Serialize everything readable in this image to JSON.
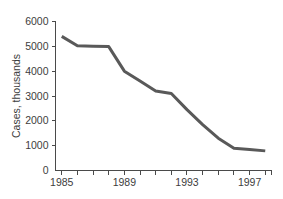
{
  "chart_data": {
    "type": "line",
    "title": "",
    "xlabel": "",
    "ylabel": "Cases, thousands",
    "xlim": [
      1984.6,
      1998.4
    ],
    "ylim": [
      0,
      6000
    ],
    "grid": false,
    "legend": false,
    "line_color": "#595959",
    "axis_color": "#4a4a4a",
    "x": [
      1985,
      1986,
      1987,
      1988,
      1989,
      1990,
      1991,
      1992,
      1993,
      1994,
      1995,
      1996,
      1997,
      1998
    ],
    "values": [
      5400,
      5020,
      5000,
      4990,
      4000,
      3600,
      3200,
      3100,
      2450,
      1850,
      1300,
      900,
      850,
      790
    ],
    "x_tick_values": [
      1985,
      1986,
      1987,
      1988,
      1989,
      1990,
      1991,
      1992,
      1993,
      1994,
      1995,
      1996,
      1997,
      1998
    ],
    "x_tick_labels": [
      "1985",
      "",
      "",
      "",
      "1989",
      "",
      "",
      "",
      "1993",
      "",
      "",
      "",
      "1997",
      ""
    ],
    "x_major_labels": [
      "1985",
      "1989",
      "1993",
      "1997"
    ],
    "y_ticks": [
      0,
      1000,
      2000,
      3000,
      4000,
      5000,
      6000
    ],
    "y_tick_labels": [
      "0",
      "1000",
      "2000",
      "3000",
      "4000",
      "5000",
      "6000"
    ]
  }
}
